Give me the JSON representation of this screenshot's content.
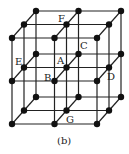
{
  "figure": {
    "caption": "(b)",
    "grid": {
      "n": 3,
      "origin": [
        12,
        124
      ],
      "step_x": 42.5,
      "step_y": -43,
      "depth_dx": 12,
      "depth_dy": -13.5
    },
    "labels": [
      {
        "text": "F",
        "x": 58,
        "y": 14
      },
      {
        "text": "C",
        "x": 80,
        "y": 41
      },
      {
        "text": "E",
        "x": 15,
        "y": 57
      },
      {
        "text": "A",
        "x": 57,
        "y": 56
      },
      {
        "text": "B",
        "x": 44,
        "y": 73
      },
      {
        "text": "D",
        "x": 107,
        "y": 72
      },
      {
        "text": "G",
        "x": 66,
        "y": 115
      }
    ],
    "colors": {
      "line": "#222222",
      "point": "#111111"
    }
  }
}
